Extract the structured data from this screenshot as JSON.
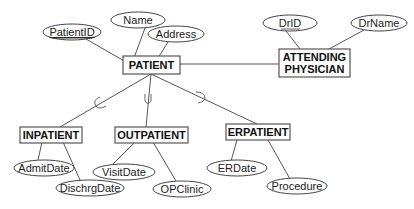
{
  "diagram": {
    "type": "EER diagram",
    "entities": {
      "patient": "PATIENT",
      "physician_line1": "ATTENDING",
      "physician_line2": "PHYSICIAN",
      "inpatient": "INPATIENT",
      "outpatient": "OUTPATIENT",
      "erpatient": "ERPATIENT"
    },
    "attributes": {
      "patient_id": "PatientID",
      "name": "Name",
      "address": "Address",
      "dr_id": "DrID",
      "dr_name": "DrName",
      "admit_date": "AdmitDate",
      "dischrg_date": "DischrgDate",
      "visit_date": "VisitDate",
      "op_clinic": "OPClinic",
      "er_date": "ERDate",
      "procedure": "Procedure"
    },
    "keys": [
      "PatientID",
      "DrID"
    ],
    "relationships": [
      {
        "from": "PATIENT",
        "to": "ATTENDING PHYSICIAN",
        "kind": "association"
      },
      {
        "from": "PATIENT",
        "to": "INPATIENT",
        "kind": "subtype"
      },
      {
        "from": "PATIENT",
        "to": "OUTPATIENT",
        "kind": "subtype"
      },
      {
        "from": "PATIENT",
        "to": "ERPATIENT",
        "kind": "subtype"
      }
    ],
    "colors": {
      "line": "#555555",
      "text": "#222222",
      "background": "#ffffff"
    }
  }
}
